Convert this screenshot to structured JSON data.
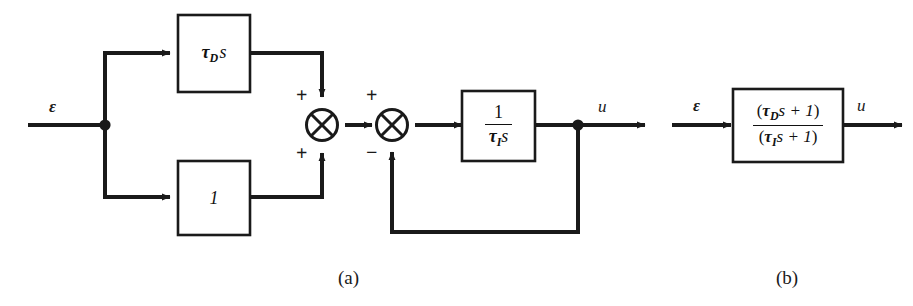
{
  "figure": {
    "background_color": "#ffffff",
    "ink_color": "#1a1a1a",
    "captions": [
      {
        "id": "caption-a",
        "text": "(a)"
      },
      {
        "id": "caption-b",
        "text": "(b)"
      }
    ]
  },
  "diagram_a": {
    "caption": "(a)",
    "input_signal_label": "ε",
    "output_signal_label": "u",
    "blocks": [
      {
        "id": "derivative-block",
        "expression": "τ_D s",
        "tau": "τ",
        "subscript": "D",
        "operator": "s"
      },
      {
        "id": "unity-block",
        "expression": "1"
      },
      {
        "id": "integrator-block",
        "expression": "1 / (τ_I s)",
        "numerator": "1",
        "denominator_tau": "τ",
        "denominator_subscript": "I",
        "denominator_operator": "s"
      }
    ],
    "summing_junctions": [
      {
        "id": "summer-1",
        "symbol": "⊗",
        "signs": [
          {
            "position": "top-left",
            "sign": "+"
          },
          {
            "position": "bottom-left",
            "sign": "+"
          }
        ]
      },
      {
        "id": "summer-2",
        "symbol": "⊗",
        "signs": [
          {
            "position": "top-left",
            "sign": "+"
          },
          {
            "position": "bottom-left",
            "sign": "−"
          }
        ]
      }
    ],
    "nodes": [
      {
        "id": "input-branch-node",
        "type": "junction-dot"
      },
      {
        "id": "output-branch-node",
        "type": "junction-dot"
      }
    ],
    "feedback": {
      "id": "feedback-path",
      "description": "output fed back to negative input of second summer"
    }
  },
  "diagram_b": {
    "caption": "(b)",
    "input_signal_label": "ε",
    "output_signal_label": "u",
    "block": {
      "id": "transfer-function-block",
      "expression": "(τ_D s + 1) / (τ_I s + 1)",
      "numerator_tau": "τ",
      "numerator_subscript": "D",
      "numerator_rest": "s + 1",
      "denominator_tau": "τ",
      "denominator_subscript": "I",
      "denominator_rest": "s + 1",
      "open_paren": "(",
      "close_paren": ")"
    }
  }
}
